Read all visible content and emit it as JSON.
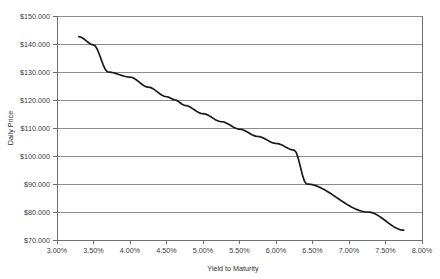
{
  "chart_data": {
    "type": "line",
    "title": "",
    "xlabel": "Yield to Maturity",
    "ylabel": "Daily Price",
    "xlim": [
      3.0,
      8.0
    ],
    "ylim": [
      70.0,
      150.0
    ],
    "grid": "horizontal",
    "legend": "none",
    "x_tick_labels": [
      "3.00%",
      "3.50%",
      "4.00%",
      "4.50%",
      "5.00%",
      "5.50%",
      "6.00%",
      "6.50%",
      "7.00%",
      "7.50%",
      "8.00%"
    ],
    "x_tick_values": [
      3.0,
      3.5,
      4.0,
      4.5,
      5.0,
      5.5,
      6.0,
      6.5,
      7.0,
      7.5,
      8.0
    ],
    "y_tick_labels": [
      "$150.000",
      "$140.000",
      "$130.000",
      "$120.000",
      "$110.000",
      "$100.000",
      "$90.000",
      "$80.000",
      "$70.000"
    ],
    "y_tick_values": [
      150.0,
      140.0,
      130.0,
      120.0,
      110.0,
      100.0,
      90.0,
      80.0,
      70.0
    ],
    "series": [
      {
        "name": "Price",
        "color": "#1a1a1a",
        "x": [
          3.3,
          3.5,
          3.7,
          4.0,
          4.25,
          4.5,
          4.62,
          4.75,
          5.0,
          5.25,
          5.5,
          5.75,
          6.0,
          6.25,
          6.42,
          6.5,
          6.75,
          7.0,
          7.26,
          7.5,
          7.75
        ],
        "y": [
          142.6,
          139.7,
          130.0,
          128.2,
          124.6,
          121.2,
          120.0,
          118.1,
          115.1,
          112.3,
          109.6,
          107.0,
          104.5,
          102.1,
          90.0,
          99.8,
          97.6,
          95.5,
          80.0,
          91.4,
          73.5
        ]
      }
    ]
  },
  "axis": {
    "x_title": "Yield to Maturity",
    "y_title": "Daily Price"
  },
  "colors": {
    "series": "#1a1a1a",
    "gridline": "#8c8c8c",
    "axis": "#6e6e6e",
    "background": "#ffffff",
    "tick_text": "#3a3a3a"
  }
}
